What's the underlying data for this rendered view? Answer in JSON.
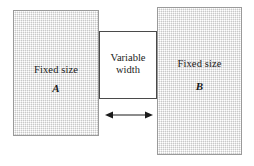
{
  "diagram": {
    "type": "layout-illustration",
    "background_color": "#ffffff",
    "blocks": [
      {
        "id": "block-a",
        "kind": "fixed",
        "title": "Fixed size",
        "letter": "A",
        "fill_color": "#e9e9e9",
        "border_color": "#9a9a9a",
        "x": 13,
        "y": 10,
        "width": 86,
        "height": 126
      },
      {
        "id": "block-variable",
        "kind": "variable",
        "title_line1": "Variable",
        "title_line2": "width",
        "fill_color": "#ffffff",
        "border_color": "#4a4a4a",
        "x": 99,
        "y": 31,
        "width": 58,
        "height": 68
      },
      {
        "id": "block-b",
        "kind": "fixed",
        "title": "Fixed size",
        "letter": "B",
        "fill_color": "#e9e9e9",
        "border_color": "#9a9a9a",
        "x": 157,
        "y": 7,
        "width": 85,
        "height": 148
      }
    ],
    "arrow": {
      "id": "width-arrow",
      "name": "double-headed-width-arrow",
      "color": "#1b1b1b",
      "x1": 105,
      "x2": 149,
      "y": 114
    }
  }
}
